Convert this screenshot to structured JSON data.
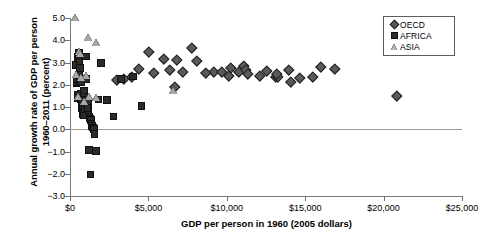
{
  "chart_data": {
    "type": "scatter",
    "title": "",
    "xlabel": "GDP per person in 1960 (2005 dollars)",
    "ylabel": "Annual growth rate of GDP per person 1960–2011 (percent)",
    "xlim": [
      0,
      25000
    ],
    "ylim": [
      -3.0,
      5.0
    ],
    "xticks": [
      0,
      5000,
      10000,
      15000,
      20000,
      25000
    ],
    "xticklabels": [
      "$0",
      "$5,000",
      "$10,000",
      "$15,000",
      "$20,000",
      "$25,000"
    ],
    "yticks": [
      5.0,
      4.0,
      3.0,
      2.0,
      1.0,
      0.0,
      -1.0,
      -2.0,
      -3.0
    ],
    "yticklabels": [
      "5.0",
      "4.0",
      "3.0",
      "2.0",
      "1.0",
      "0.0",
      "−1.0",
      "−2.0",
      "−3.0"
    ],
    "grid": false,
    "zero_reference_line": 0.0,
    "legend_position": "top-right",
    "series": [
      {
        "name": "OECD",
        "marker": "diamond",
        "color": "#5a5a5a",
        "points": [
          [
            4950,
            3.52
          ],
          [
            5900,
            3.2
          ],
          [
            5250,
            2.56
          ],
          [
            6300,
            2.7
          ],
          [
            6600,
            1.95
          ],
          [
            7700,
            3.71
          ],
          [
            4350,
            2.78
          ],
          [
            8000,
            3.1
          ],
          [
            9100,
            2.64
          ],
          [
            9600,
            2.62
          ],
          [
            10200,
            2.82
          ],
          [
            10700,
            2.63
          ],
          [
            11050,
            2.9
          ],
          [
            11150,
            2.72
          ],
          [
            11250,
            2.55
          ],
          [
            12500,
            2.68
          ],
          [
            13050,
            2.4
          ],
          [
            13200,
            2.38
          ],
          [
            13150,
            2.52
          ],
          [
            13900,
            2.72
          ],
          [
            14000,
            2.16
          ],
          [
            14600,
            2.35
          ],
          [
            15400,
            2.38
          ],
          [
            15950,
            2.87
          ],
          [
            16850,
            2.75
          ],
          [
            20800,
            1.55
          ],
          [
            7100,
            2.62
          ],
          [
            12050,
            2.46
          ],
          [
            3900,
            2.42
          ],
          [
            3350,
            2.32
          ],
          [
            8600,
            2.6
          ],
          [
            10050,
            2.45
          ],
          [
            6750,
            3.18
          ],
          [
            2950,
            2.27
          ]
        ]
      },
      {
        "name": "AFRICA",
        "marker": "square",
        "color": "#2b2b2b",
        "points": [
          [
            330,
            2.92
          ],
          [
            360,
            2.12
          ],
          [
            380,
            2.18
          ],
          [
            400,
            2.3
          ],
          [
            420,
            1.58
          ],
          [
            450,
            1.45
          ],
          [
            460,
            3.28
          ],
          [
            480,
            3.42
          ],
          [
            500,
            3.5
          ],
          [
            520,
            3.36
          ],
          [
            540,
            3.07
          ],
          [
            560,
            2.8
          ],
          [
            580,
            2.22
          ],
          [
            600,
            2.25
          ],
          [
            620,
            1.62
          ],
          [
            640,
            1.4
          ],
          [
            660,
            1.28
          ],
          [
            680,
            1.22
          ],
          [
            700,
            1.1
          ],
          [
            720,
            1.0
          ],
          [
            740,
            0.92
          ],
          [
            760,
            0.78
          ],
          [
            780,
            0.72
          ],
          [
            800,
            0.66
          ],
          [
            820,
            1.78
          ],
          [
            840,
            1.52
          ],
          [
            860,
            1.38
          ],
          [
            880,
            1.18
          ],
          [
            900,
            0.95
          ],
          [
            950,
            3.32
          ],
          [
            980,
            2.3
          ],
          [
            1020,
            1.35
          ],
          [
            1080,
            1.22
          ],
          [
            1120,
            0.88
          ],
          [
            1180,
            0.6
          ],
          [
            1220,
            0.52
          ],
          [
            1260,
            0.45
          ],
          [
            1300,
            0.3
          ],
          [
            1350,
            0.18
          ],
          [
            1400,
            0.12
          ],
          [
            1450,
            0.05
          ],
          [
            1500,
            -0.18
          ],
          [
            1550,
            -0.95
          ],
          [
            1600,
            -0.92
          ],
          [
            1150,
            -0.88
          ],
          [
            1250,
            -1.98
          ],
          [
            1900,
            3.02
          ],
          [
            2300,
            1.35
          ],
          [
            2700,
            0.62
          ],
          [
            3200,
            2.3
          ],
          [
            3950,
            2.42
          ],
          [
            4500,
            1.08
          ],
          [
            1750,
            1.38
          ],
          [
            520,
            2.48
          ],
          [
            1050,
            1.0
          ],
          [
            620,
            2.18
          ]
        ]
      },
      {
        "name": "ASIA",
        "marker": "triangle",
        "color": "#a8a8a8",
        "points": [
          [
            300,
            4.98
          ],
          [
            1150,
            4.1
          ],
          [
            1700,
            3.85
          ],
          [
            560,
            3.45
          ],
          [
            620,
            3.38
          ],
          [
            420,
            2.42
          ],
          [
            1050,
            2.38
          ],
          [
            700,
            2.3
          ],
          [
            540,
            1.42
          ],
          [
            1200,
            1.42
          ],
          [
            1700,
            1.38
          ],
          [
            6550,
            1.68
          ],
          [
            880,
            1.2
          ]
        ]
      }
    ]
  },
  "legend": {
    "items": [
      {
        "label": "OECD",
        "symbol": "diamond-icon"
      },
      {
        "label": "AFRICA",
        "symbol": "square-icon"
      },
      {
        "label": "ASIA",
        "symbol": "triangle-icon"
      }
    ]
  }
}
